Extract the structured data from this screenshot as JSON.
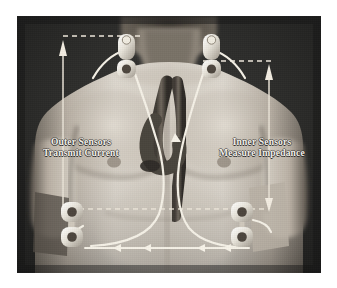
{
  "figure": {
    "background_color": "#262626",
    "page_color": "#ffffff",
    "skin_tone_light": "#d8d2c8",
    "skin_tone_mid": "#a79f94",
    "skin_tone_dark": "#6d665d",
    "line_color": "#f0ece4",
    "label_color": "#f2f0ea"
  },
  "captions": {
    "left": {
      "line1": "Outer Sensors",
      "line2": "Transmit Current"
    },
    "right": {
      "line1": "Inner Sensors",
      "line2": "Measure Impedance"
    }
  },
  "sensors": [
    {
      "id": "neck-left",
      "name": "outer-sensor-neck-left",
      "position": "left side of neck, above clavicle"
    },
    {
      "id": "neck-right",
      "name": "outer-sensor-neck-right",
      "position": "right side of neck, above clavicle"
    },
    {
      "id": "waist-left",
      "name": "inner-sensor-waist-left",
      "position": "left lower torso at waistline"
    },
    {
      "id": "waist-right",
      "name": "inner-sensor-waist-right",
      "position": "right lower torso at waistline"
    }
  ],
  "annotations": {
    "dashed_guides": [
      {
        "id": "guide-top-left",
        "orientation": "horizontal",
        "note": "upper neck sensor level, left"
      },
      {
        "id": "guide-top-right",
        "orientation": "horizontal",
        "note": "upper neck sensor level, right"
      },
      {
        "id": "guide-waist",
        "orientation": "horizontal",
        "note": "waist sensor level across torso"
      }
    ],
    "arrows": [
      {
        "id": "arrow-left-vertical",
        "direction": "up",
        "note": "left measurement span arrow"
      },
      {
        "id": "arrow-right-vertical",
        "direction": "up",
        "note": "right measurement span arrow, down head at waist"
      },
      {
        "id": "arrow-current-flow",
        "direction": "left",
        "note": "current flow chevrons along lower lead wire"
      }
    ]
  },
  "anatomy": {
    "heart_vessel": "aortic arch and great vessels",
    "leads": "white electrode lead wires running from neck sensors down the sternum to waist sensors"
  }
}
